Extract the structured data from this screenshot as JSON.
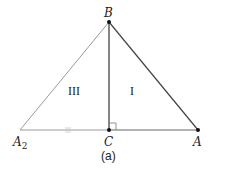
{
  "diagram": {
    "caption": "(a)",
    "vertices": {
      "B": {
        "label": "B",
        "x": 109,
        "y": 22
      },
      "C": {
        "label": "C",
        "x": 109,
        "y": 130
      },
      "A": {
        "label": "A",
        "x": 198,
        "y": 130
      },
      "A2": {
        "label": "A",
        "subscript": "2",
        "x": 20,
        "y": 130
      }
    },
    "regions": [
      {
        "label": "III",
        "x": 77,
        "y": 94
      },
      {
        "label": "I",
        "x": 132,
        "y": 94
      }
    ],
    "colors": {
      "dark_line": "#333333",
      "light_line": "#9a9a9a",
      "point": "#111111"
    }
  }
}
